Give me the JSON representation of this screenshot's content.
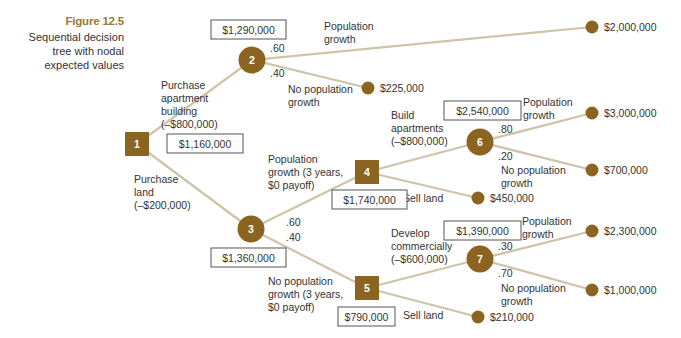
{
  "caption": {
    "figure": "Figure 12.5",
    "description_lines": [
      "Sequential decision",
      "tree with nodal",
      "expected values"
    ]
  },
  "colors": {
    "node_fill": "#8a6420",
    "branch": "#cfc3a8",
    "caption_accent": "#9a7a2e",
    "text": "#333333"
  },
  "decision_nodes": [
    {
      "id": "1",
      "shape": "square",
      "cx": 137,
      "cy": 144,
      "expected_value": "$1,160,000"
    },
    {
      "id": "4",
      "shape": "square",
      "cx": 367,
      "cy": 172,
      "expected_value": "$1,740,000"
    },
    {
      "id": "5",
      "shape": "square",
      "cx": 367,
      "cy": 288,
      "expected_value": "$790,000"
    }
  ],
  "chance_nodes": [
    {
      "id": "2",
      "shape": "circle",
      "cx": 252,
      "cy": 60,
      "expected_value": "$1,290,000"
    },
    {
      "id": "3",
      "shape": "circle",
      "cx": 251,
      "cy": 229,
      "expected_value": "$1,360,000"
    },
    {
      "id": "6",
      "shape": "circle",
      "cx": 480,
      "cy": 142,
      "expected_value": "$2,540,000"
    },
    {
      "id": "7",
      "shape": "circle",
      "cx": 480,
      "cy": 259,
      "expected_value": "$1,390,000"
    }
  ],
  "branches": {
    "n1_n2": {
      "label_lines": [
        "Purchase",
        "apartment",
        "building",
        "(–$800,000)"
      ]
    },
    "n1_n3": {
      "label_lines": [
        "Purchase",
        "land",
        "(–$200,000)"
      ]
    },
    "n2_t1": {
      "prob": ".60",
      "label_lines": [
        "Population",
        "growth"
      ]
    },
    "n2_t2": {
      "prob": ".40",
      "label_lines": [
        "No population",
        "growth"
      ]
    },
    "n3_n4": {
      "prob": ".60",
      "label_lines": [
        "Population",
        "growth (3 years,",
        "$0 payoff)"
      ]
    },
    "n3_n5": {
      "prob": ".40",
      "label_lines": [
        "No population",
        "growth (3 years,",
        "$0 payoff)"
      ]
    },
    "n4_n6": {
      "label_lines": [
        "Build",
        "apartments",
        "(–$800,000)"
      ]
    },
    "n4_t5": {
      "label_lines": [
        "Sell land"
      ]
    },
    "n6_t3": {
      "prob": ".80",
      "label_lines": [
        "Population",
        "growth"
      ]
    },
    "n6_t4": {
      "prob": ".20",
      "label_lines": [
        "No population",
        "growth"
      ]
    },
    "n5_n7": {
      "label_lines": [
        "Develop",
        "commercially",
        "(–$600,000)"
      ]
    },
    "n5_t8": {
      "label_lines": [
        "Sell land"
      ]
    },
    "n7_t6": {
      "prob": ".30",
      "label_lines": [
        "Population",
        "growth"
      ]
    },
    "n7_t7": {
      "prob": ".70",
      "label_lines": [
        "No population",
        "growth"
      ]
    }
  },
  "terminals": [
    {
      "id": "t1",
      "cx": 592,
      "cy": 27,
      "payoff": "$2,000,000"
    },
    {
      "id": "t2",
      "cx": 368,
      "cy": 88,
      "payoff": "$225,000"
    },
    {
      "id": "t3",
      "cx": 592,
      "cy": 113,
      "payoff": "$3,000,000"
    },
    {
      "id": "t4",
      "cx": 592,
      "cy": 170,
      "payoff": "$700,000"
    },
    {
      "id": "t5",
      "cx": 478,
      "cy": 198,
      "payoff": "$450,000"
    },
    {
      "id": "t6",
      "cx": 592,
      "cy": 231,
      "payoff": "$2,300,000"
    },
    {
      "id": "t7",
      "cx": 592,
      "cy": 290,
      "payoff": "$1,000,000"
    },
    {
      "id": "t8",
      "cx": 478,
      "cy": 317,
      "payoff": "$210,000"
    }
  ]
}
